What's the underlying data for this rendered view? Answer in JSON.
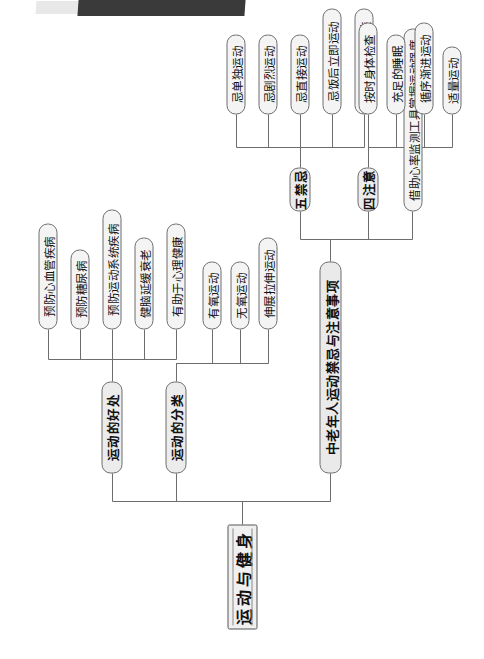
{
  "page": {
    "title": "运动与健身",
    "orientation": "rotated-90",
    "top_artifact": "dark-scan-bar"
  },
  "colors": {
    "node_fill": "#f2f2f2",
    "node_border": "#6d6d6d",
    "wire": "#6d6d6d",
    "text": "#111111",
    "artifact_dark": "#3a3a3a",
    "artifact_light": "#e8e8e8",
    "background": "#ffffff"
  },
  "mindmap": {
    "root": {
      "label": "运动与健身"
    },
    "branches": [
      {
        "label": "运动的好处",
        "children": [
          {
            "label": "预防心血管疾病"
          },
          {
            "label": "预防糖尿病"
          },
          {
            "label": "预防运动系统疾病"
          },
          {
            "label": "健脑延缓衰老"
          },
          {
            "label": "有助于心理健康"
          }
        ]
      },
      {
        "label": "运动的分类",
        "children": [
          {
            "label": "有氧运动"
          },
          {
            "label": "无氧运动"
          },
          {
            "label": "伸展拉伸运动"
          }
        ]
      },
      {
        "label": "中老年人运动禁忌与注意事项",
        "children": [
          {
            "label": "五禁忌",
            "children": [
              {
                "label": "忌单独运动"
              },
              {
                "label": "忌剧烈运动"
              },
              {
                "label": "忌直接运动"
              },
              {
                "label": "忌饭后立即运动"
              },
              {
                "label": "忌穿不适宜着装"
              }
            ]
          },
          {
            "label": "四注意",
            "children": [
              {
                "label": "按时身体检查"
              },
              {
                "label": "充足的睡眠"
              },
              {
                "label": "循序渐进运动"
              },
              {
                "label": "适量运动"
              }
            ]
          },
          {
            "label": "借助心率监测工具掌握运动强度",
            "children": []
          }
        ]
      }
    ]
  }
}
